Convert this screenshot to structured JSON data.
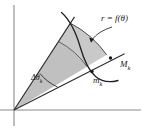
{
  "figure": {
    "kind": "polar-sector-diagram",
    "background_color": "#ffffff",
    "labels": {
      "curve": "r = f(θ)",
      "outer_radius": "M",
      "outer_radius_sub": "k",
      "inner_radius": "m",
      "inner_radius_sub": "k",
      "angle_delta": "Δθ",
      "angle_delta_sub": "k"
    },
    "colors": {
      "sector_fill": "#c9c9c9",
      "inner_band_fill": "#b9b9b9",
      "stroke": "#2b2b2b",
      "axis": "#7a7a7a"
    },
    "axes": {
      "origin_x": 14,
      "origin_y": 110,
      "x_axis_end": 141,
      "y_axis_top": 5,
      "y_axis_bottom": 126
    },
    "geometry": {
      "ray_lower_angle_deg": 27,
      "ray_upper_angle_deg": 57,
      "inner_radius_px": 82,
      "outer_radius_px": 104,
      "curve_radius_px": 96
    }
  }
}
